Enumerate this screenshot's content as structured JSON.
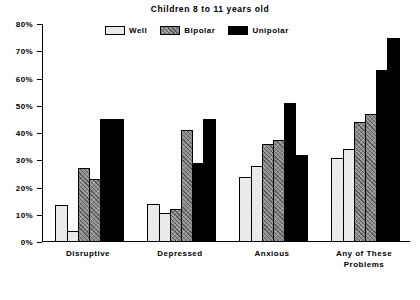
{
  "chart_data": {
    "type": "bar",
    "title": "Children 8 to 11 years old",
    "xlabel": "",
    "ylabel": "",
    "ylim": [
      0,
      80
    ],
    "ytick_values": [
      0,
      10,
      20,
      30,
      40,
      50,
      60,
      70,
      80
    ],
    "ytick_labels": [
      "0%",
      "10%",
      "20%",
      "30%",
      "40%",
      "50%",
      "60%",
      "70%",
      "80%"
    ],
    "grid": false,
    "legend_position": "top-center",
    "categories": [
      "Disruptive",
      "Depressed",
      "Anxious",
      "Any of These Problems"
    ],
    "legend": [
      "Well",
      "Bipolar",
      "Unipolar"
    ],
    "series": [
      {
        "name": "Well",
        "fill": "light-stipple",
        "values": [
          [
            13.5,
            4.0
          ],
          [
            14.0,
            10.5
          ],
          [
            24.0,
            28.0
          ],
          [
            31.0,
            34.0
          ]
        ]
      },
      {
        "name": "Bipolar",
        "fill": "dark-hatch",
        "values": [
          [
            27.0,
            23.0
          ],
          [
            12.0,
            41.0
          ],
          [
            36.0,
            37.5
          ],
          [
            44.0,
            47.0
          ]
        ]
      },
      {
        "name": "Unipolar",
        "fill": "solid-black",
        "values": [
          [
            45.0,
            45.0
          ],
          [
            29.0,
            45.0
          ],
          [
            51.0,
            32.0
          ],
          [
            63.0,
            75.0
          ]
        ]
      }
    ],
    "bars_per_group": 6,
    "group_bar_order": [
      "Well",
      "Well",
      "Bipolar",
      "Bipolar",
      "Unipolar",
      "Unipolar"
    ],
    "group_values": [
      [
        13.5,
        4.0,
        27.0,
        23.0,
        45.0,
        45.0
      ],
      [
        14.0,
        10.5,
        12.0,
        41.0,
        29.0,
        45.0
      ],
      [
        24.0,
        28.0,
        36.0,
        37.5,
        51.0,
        32.0
      ],
      [
        31.0,
        34.0,
        44.0,
        47.0,
        63.0,
        75.0
      ]
    ]
  },
  "categories_display": [
    {
      "line1": "Disruptive",
      "line2": ""
    },
    {
      "line1": "Depressed",
      "line2": ""
    },
    {
      "line1": "Anxious",
      "line2": ""
    },
    {
      "line1": "Any of These",
      "line2": "Problems"
    }
  ],
  "legend_items": [
    {
      "label": "Well",
      "swatch": "well-swatch"
    },
    {
      "label": "Bipolar",
      "swatch": "bipolar-swatch"
    },
    {
      "label": "Unipolar",
      "swatch": "unipolar-swatch"
    }
  ],
  "colors": {
    "well": "#dededa",
    "bipolar": "#8e8e8e",
    "unipolar": "#000000",
    "axis": "#000000",
    "background": "#ffffff"
  }
}
